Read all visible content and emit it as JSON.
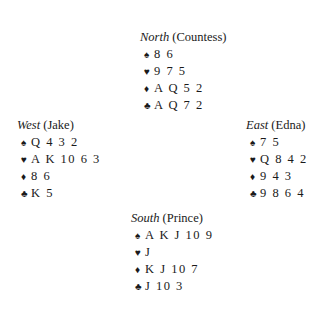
{
  "hands": {
    "north": {
      "seat": "North",
      "player": "(Countess)",
      "spades": "8 6",
      "hearts": "9 7 5",
      "diamonds": "A Q 5 2",
      "clubs": "A Q 7 2"
    },
    "west": {
      "seat": "West",
      "player": "(Jake)",
      "spades": "Q 4 3 2",
      "hearts": "A K 10 6 3",
      "diamonds": "8 6",
      "clubs": "K 5"
    },
    "east": {
      "seat": "East",
      "player": "(Edna)",
      "spades": "7 5",
      "hearts": "Q 8 4 2",
      "diamonds": "9 4 3",
      "clubs": "9 8 6 4"
    },
    "south": {
      "seat": "South",
      "player": "(Prince)",
      "spades": "A K J 10 9",
      "hearts": "J",
      "diamonds": "K J 10 7",
      "clubs": "J 10 3"
    }
  },
  "icons": {
    "spade": "♠",
    "heart": "♥",
    "diamond": "♦",
    "club": "♣"
  }
}
